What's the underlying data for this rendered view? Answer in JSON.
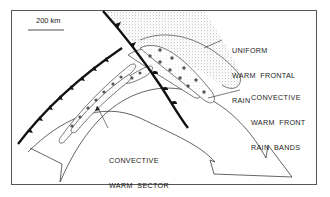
{
  "scale_bar": {
    "label": "200 km"
  },
  "labels": {
    "uniform_warm_frontal_rain": [
      "UNIFORM",
      "WARM  FRONTAL",
      "RAIN"
    ],
    "convective_warm_front_rain_bands": [
      "CONVECTIVE",
      "WARM  FRONT",
      "RAIN  BANDS"
    ],
    "convective_warm_sector_rain_bands": [
      "CONVECTIVE",
      "WARM  SECTOR",
      "RAIN  BANDS"
    ]
  },
  "colors": {
    "line": "#111111",
    "frame": "#555555",
    "stipple": "#888888",
    "background": "#ffffff"
  }
}
